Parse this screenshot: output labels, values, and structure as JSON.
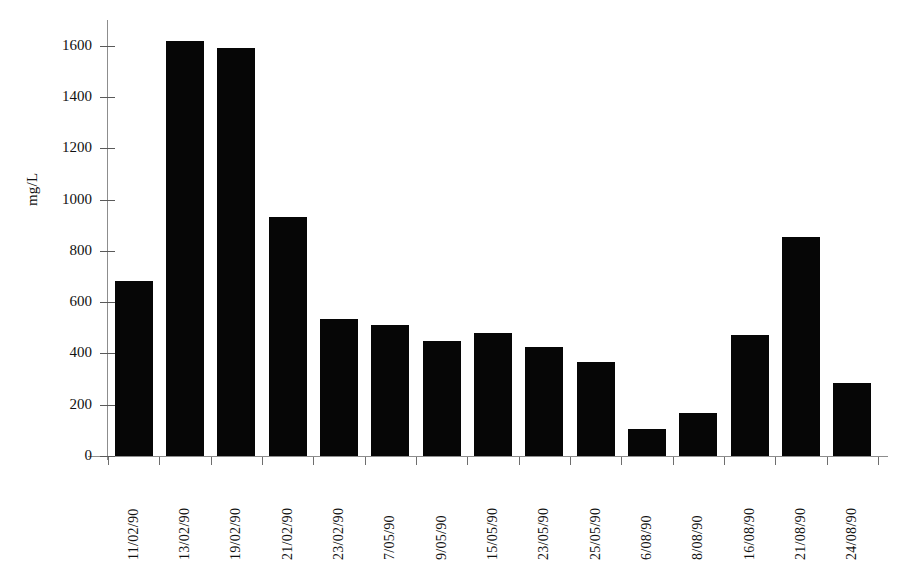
{
  "chart_data": {
    "type": "bar",
    "title": "",
    "subtitle": "",
    "xlabel": "",
    "ylabel": "mg/L",
    "ylim": [
      0,
      1700
    ],
    "ytick_values": [
      0,
      200,
      400,
      600,
      800,
      1000,
      1200,
      1400,
      1600
    ],
    "ytick_labels": [
      "0",
      "200",
      "400",
      "600",
      "800",
      "1000",
      "1200",
      "1400",
      "1600"
    ],
    "grid": false,
    "legend": null,
    "bar_color": "#060606",
    "axis_color": "#8d8d8d",
    "categories": [
      "11/02/90",
      "13/02/90",
      "19/02/90",
      "21/02/90",
      "23/02/90",
      "7/05/90",
      "9/05/90",
      "15/05/90",
      "23/05/90",
      "25/05/90",
      "6/08/90",
      "8/08/90",
      "16/08/90",
      "21/08/90",
      "24/08/90"
    ],
    "values": [
      682,
      1620,
      1590,
      930,
      535,
      510,
      447,
      480,
      425,
      368,
      105,
      168,
      470,
      855,
      285
    ],
    "series": [
      {
        "name": "mg/L",
        "values": [
          682,
          1620,
          1590,
          930,
          535,
          510,
          447,
          480,
          425,
          368,
          105,
          168,
          470,
          855,
          285
        ]
      }
    ]
  }
}
